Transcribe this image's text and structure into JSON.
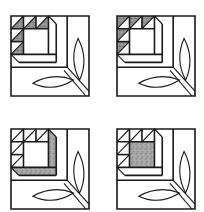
{
  "figure": {
    "colors": {
      "outline": "#1a1a1a",
      "shade": "#9a9a9a",
      "shade_dark": "#6e6e6e",
      "background": "#ffffff"
    },
    "blocks": [
      {
        "id": "block-1",
        "position": "top-left",
        "shaded": "top-row-triangles"
      },
      {
        "id": "block-2",
        "position": "top-right",
        "shaded": "all-triangles"
      },
      {
        "id": "block-3",
        "position": "bottom-left",
        "shaded": "l-frame-strips"
      },
      {
        "id": "block-4",
        "position": "bottom-right",
        "shaded": "center-square"
      }
    ]
  }
}
